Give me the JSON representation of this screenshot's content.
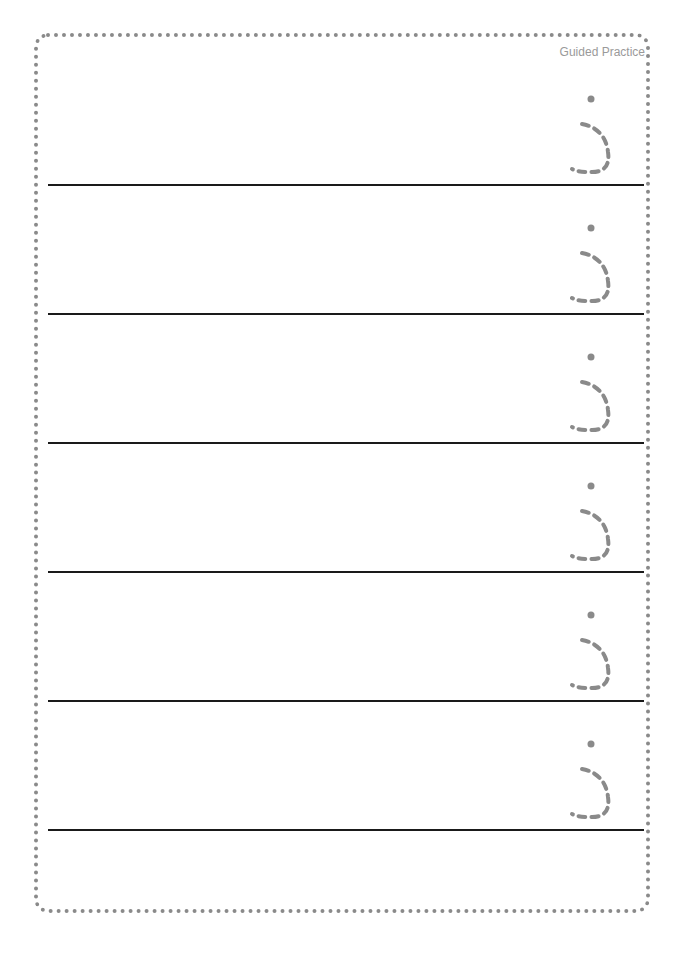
{
  "header": {
    "label": "Guided Practice"
  },
  "worksheet": {
    "letter": "ذ",
    "letter_style": "dashed-trace",
    "trace_color": "#8a8a8a",
    "line_color": "#1a1a1a",
    "rows": [
      {
        "index": 1
      },
      {
        "index": 2
      },
      {
        "index": 3
      },
      {
        "index": 4
      },
      {
        "index": 5
      },
      {
        "index": 6
      }
    ]
  }
}
